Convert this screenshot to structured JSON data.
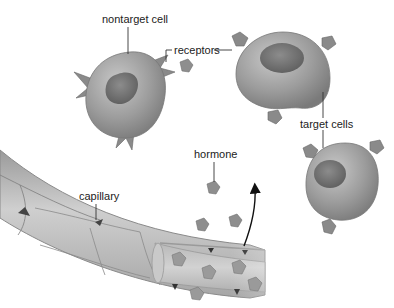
{
  "diagram": {
    "labels": {
      "nontarget_cell": "nontarget cell",
      "receptors": "receptors",
      "target_cells": "target cells",
      "hormone": "hormone",
      "capillary": "capillary"
    },
    "colors": {
      "background": "#ffffff",
      "cell_body": "#9a9a9a",
      "cell_highlight": "#c4c4c4",
      "nucleus": "#6e6e6e",
      "receptor": "#8a8a8a",
      "hormone": "#8c8c8c",
      "capillary": "#b8b8b8",
      "leader_line": "#333333",
      "arrow": "#111111"
    },
    "elements": {
      "nontarget_cell": {
        "cx": 128,
        "cy": 90,
        "receptor_type": "spiky (non-matching)"
      },
      "target_cells": [
        {
          "cx": 283,
          "cy": 70
        },
        {
          "cx": 347,
          "cy": 180
        }
      ],
      "hormones_free": 5,
      "hormones_in_capillary": 5,
      "arrow": "hormone exits capillary toward target cells"
    }
  }
}
